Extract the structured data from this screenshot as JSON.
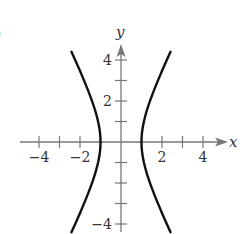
{
  "figure": {
    "partial_label": ")"
  },
  "chart_data": {
    "type": "line",
    "title": "",
    "xlabel": "x",
    "ylabel": "y",
    "xlim": [
      -5,
      5
    ],
    "ylim": [
      -4.8,
      4.8
    ],
    "x_ticks": [
      -4,
      -3,
      -2,
      -1,
      1,
      2,
      3,
      4
    ],
    "x_tick_labels": [
      "-4",
      "-2",
      "2",
      "4"
    ],
    "y_ticks": [
      -4,
      -3,
      -2,
      -1,
      1,
      2,
      3,
      4
    ],
    "y_tick_labels": [
      "4",
      "2",
      "-4"
    ],
    "grid": false,
    "equation": "x^2 - y^2/4 = 1",
    "series": [
      {
        "name": "left branch",
        "x": [
          -2.42,
          -2.06,
          -1.8,
          -1.56,
          -1.35,
          -1.17,
          -1.06,
          -1.0,
          -1.06,
          -1.17,
          -1.35,
          -1.56,
          -1.8,
          -2.06,
          -2.42
        ],
        "y": [
          4.4,
          3.5,
          3.0,
          2.4,
          1.8,
          1.2,
          0.7,
          0.0,
          -0.7,
          -1.2,
          -1.8,
          -2.4,
          -3.0,
          -3.5,
          -4.4
        ]
      },
      {
        "name": "right branch",
        "x": [
          2.42,
          2.06,
          1.8,
          1.56,
          1.35,
          1.17,
          1.06,
          1.0,
          1.06,
          1.17,
          1.35,
          1.56,
          1.8,
          2.06,
          2.42
        ],
        "y": [
          4.4,
          3.5,
          3.0,
          2.4,
          1.8,
          1.2,
          0.7,
          0.0,
          -0.7,
          -1.2,
          -1.8,
          -2.4,
          -3.0,
          -3.5,
          -4.4
        ]
      }
    ],
    "colors": {
      "axis": "#777777",
      "curve": "#111111",
      "text": "#333333"
    }
  }
}
